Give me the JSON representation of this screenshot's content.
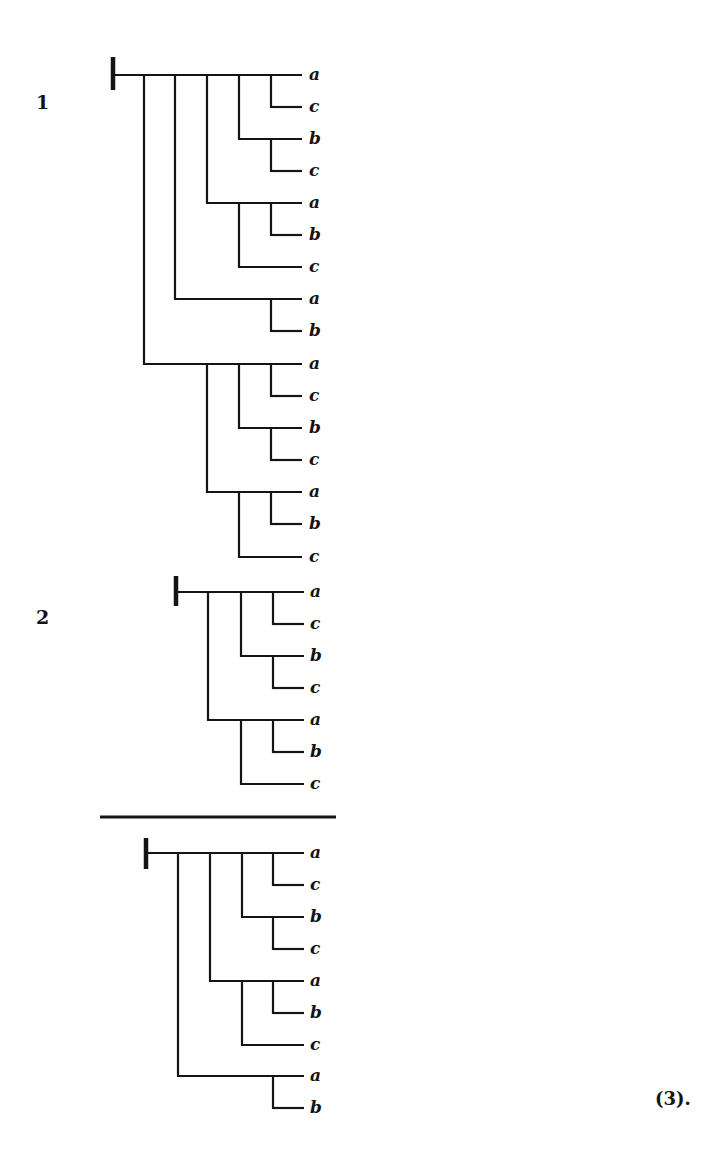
{
  "colors": {
    "ink": "#141414",
    "background": "#ffffff"
  },
  "labels": {
    "tree1_number": "1",
    "tree2_number": "2",
    "equation_ref": "(3)."
  },
  "separator": {
    "x1": 100,
    "x2": 336,
    "y": 817
  },
  "trees": [
    {
      "id": "tree-1",
      "root": {
        "x": 113,
        "y_top": 57,
        "y_bottom": 90
      },
      "leaf_end_x": 302,
      "label_x": 309,
      "rows": [
        {
          "y": 75,
          "from_x": 113,
          "parent_y": 75,
          "label": "a"
        },
        {
          "y": 107,
          "from_x": 271,
          "parent_y": 75,
          "label": "c"
        },
        {
          "y": 139,
          "from_x": 239,
          "parent_y": 75,
          "label": "b"
        },
        {
          "y": 171,
          "from_x": 271,
          "parent_y": 139,
          "label": "c"
        },
        {
          "y": 203,
          "from_x": 207,
          "parent_y": 75,
          "label": "a"
        },
        {
          "y": 235,
          "from_x": 271,
          "parent_y": 203,
          "label": "b"
        },
        {
          "y": 267,
          "from_x": 239,
          "parent_y": 203,
          "label": "c"
        },
        {
          "y": 299,
          "from_x": 175,
          "parent_y": 75,
          "label": "a"
        },
        {
          "y": 331,
          "from_x": 271,
          "parent_y": 299,
          "label": "b"
        },
        {
          "y": 364,
          "from_x": 144,
          "parent_y": 75,
          "label": "a"
        },
        {
          "y": 396,
          "from_x": 271,
          "parent_y": 364,
          "label": "c"
        },
        {
          "y": 428,
          "from_x": 239,
          "parent_y": 364,
          "label": "b"
        },
        {
          "y": 460,
          "from_x": 271,
          "parent_y": 428,
          "label": "c"
        },
        {
          "y": 492,
          "from_x": 207,
          "parent_y": 364,
          "label": "a"
        },
        {
          "y": 524,
          "from_x": 271,
          "parent_y": 492,
          "label": "b"
        },
        {
          "y": 557,
          "from_x": 239,
          "parent_y": 492,
          "label": "c"
        }
      ]
    },
    {
      "id": "tree-2",
      "root": {
        "x": 176,
        "y_top": 576,
        "y_bottom": 606
      },
      "leaf_end_x": 304,
      "label_x": 310,
      "rows": [
        {
          "y": 592,
          "from_x": 176,
          "parent_y": 592,
          "label": "a"
        },
        {
          "y": 624,
          "from_x": 273,
          "parent_y": 592,
          "label": "c"
        },
        {
          "y": 656,
          "from_x": 241,
          "parent_y": 592,
          "label": "b"
        },
        {
          "y": 688,
          "from_x": 273,
          "parent_y": 656,
          "label": "c"
        },
        {
          "y": 720,
          "from_x": 208,
          "parent_y": 592,
          "label": "a"
        },
        {
          "y": 752,
          "from_x": 273,
          "parent_y": 720,
          "label": "b"
        },
        {
          "y": 784,
          "from_x": 241,
          "parent_y": 720,
          "label": "c"
        }
      ]
    },
    {
      "id": "tree-3",
      "root": {
        "x": 146,
        "y_top": 838,
        "y_bottom": 869
      },
      "lef": null,
      "leaf_end_x": 304,
      "label_x": 310,
      "rows": [
        {
          "y": 853,
          "from_x": 146,
          "parent_y": 853,
          "label": "a"
        },
        {
          "y": 885,
          "from_x": 273,
          "parent_y": 853,
          "label": "c"
        },
        {
          "y": 917,
          "from_x": 242,
          "parent_y": 853,
          "label": "b"
        },
        {
          "y": 949,
          "from_x": 273,
          "parent_y": 917,
          "label": "c"
        },
        {
          "y": 981,
          "from_x": 210,
          "parent_y": 853,
          "label": "a"
        },
        {
          "y": 1013,
          "from_x": 273,
          "parent_y": 981,
          "label": "b"
        },
        {
          "y": 1045,
          "from_x": 242,
          "parent_y": 981,
          "label": "c"
        },
        {
          "y": 1076,
          "from_x": 178,
          "parent_y": 853,
          "label": "a"
        },
        {
          "y": 1108,
          "from_x": 273,
          "parent_y": 1076,
          "label": "b"
        }
      ]
    }
  ]
}
